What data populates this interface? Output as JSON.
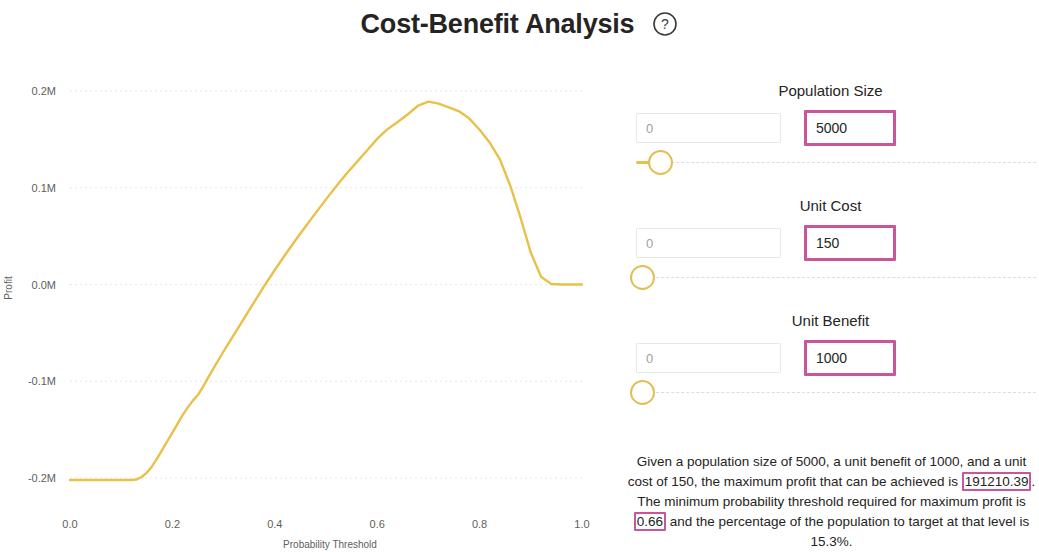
{
  "header": {
    "title": "Cost-Benefit Analysis",
    "help_icon": "question-circle-icon"
  },
  "chart_data": {
    "type": "line",
    "title": "",
    "xlabel": "Probability Threshold",
    "ylabel": "Profit",
    "xlim": [
      0.0,
      1.0
    ],
    "ylim": [
      -0.2,
      0.2
    ],
    "xtick_labels": [
      "0.0",
      "0.2",
      "0.4",
      "0.6",
      "0.8",
      "1.0"
    ],
    "xticks": [
      0.0,
      0.2,
      0.4,
      0.6,
      0.8,
      1.0
    ],
    "ytick_labels": [
      "0.2M",
      "0.1M",
      "0.0M",
      "-0.1M",
      "-0.2M"
    ],
    "yticks": [
      0.2,
      0.1,
      0.0,
      -0.1,
      -0.2
    ],
    "grid": true,
    "line_color": "#e8c14a",
    "series": [
      {
        "name": "Profit",
        "x": [
          0.0,
          0.02,
          0.04,
          0.06,
          0.08,
          0.1,
          0.12,
          0.13,
          0.14,
          0.15,
          0.16,
          0.17,
          0.18,
          0.19,
          0.2,
          0.21,
          0.22,
          0.23,
          0.24,
          0.25,
          0.26,
          0.27,
          0.28,
          0.3,
          0.32,
          0.34,
          0.36,
          0.38,
          0.4,
          0.42,
          0.44,
          0.46,
          0.48,
          0.5,
          0.52,
          0.54,
          0.56,
          0.58,
          0.6,
          0.62,
          0.64,
          0.66,
          0.68,
          0.7,
          0.72,
          0.74,
          0.76,
          0.78,
          0.8,
          0.82,
          0.84,
          0.86,
          0.88,
          0.9,
          0.92,
          0.94,
          0.96,
          0.98,
          1.0
        ],
        "y": [
          -0.202,
          -0.202,
          -0.202,
          -0.202,
          -0.202,
          -0.202,
          -0.202,
          -0.2015,
          -0.199,
          -0.1945,
          -0.188,
          -0.18,
          -0.171,
          -0.162,
          -0.153,
          -0.144,
          -0.135,
          -0.127,
          -0.12,
          -0.114,
          -0.1055,
          -0.096,
          -0.087,
          -0.069,
          -0.052,
          -0.035,
          -0.018,
          -0.001,
          0.015,
          0.0305,
          0.0455,
          0.06,
          0.074,
          0.088,
          0.1015,
          0.1145,
          0.1265,
          0.1385,
          0.1505,
          0.1605,
          0.168,
          0.176,
          0.185,
          0.189,
          0.187,
          0.183,
          0.179,
          0.1715,
          0.16,
          0.1465,
          0.129,
          0.102,
          0.069,
          0.033,
          0.008,
          0.0005,
          0.0,
          0.0,
          0.0
        ]
      }
    ]
  },
  "controls": [
    {
      "label": "Population Size",
      "min_value": "0",
      "max_value": "5000",
      "handle_position_pct": 5,
      "fill_width_pct": 4
    },
    {
      "label": "Unit Cost",
      "min_value": "0",
      "max_value": "150",
      "handle_position_pct": 0,
      "fill_width_pct": 0
    },
    {
      "label": "Unit Benefit",
      "min_value": "0",
      "max_value": "1000",
      "handle_position_pct": 0,
      "fill_width_pct": 0
    }
  ],
  "summary": {
    "part1": "Given a population size of 5000, a unit benefit of 1000, and a unit cost of 150, the maximum profit that can be achieved is ",
    "max_profit": "191210.39",
    "part2": ". The minimum probability threshold required for maximum profit is ",
    "threshold": "0.66",
    "part3": " and the percentage of the population to target at that level is 15.3%."
  },
  "colors": {
    "accent_line": "#e8c14a",
    "highlight_border": "#c9559a",
    "text": "#252423",
    "muted_text": "#605e5c"
  }
}
